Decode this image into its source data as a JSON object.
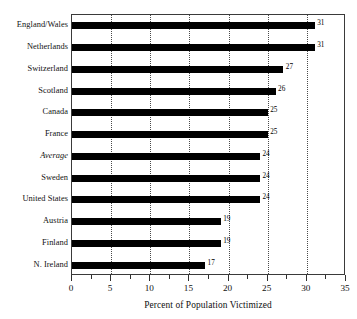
{
  "chart_data": {
    "type": "bar",
    "orientation": "horizontal",
    "title": "",
    "xlabel": "Percent of Population Victimized",
    "ylabel": "",
    "xlim": [
      0,
      35
    ],
    "ylim": null,
    "grid": "vertical-dotted-at-major-ticks",
    "legend": "none",
    "x_major_ticks": [
      0,
      5,
      10,
      15,
      20,
      25,
      30,
      35
    ],
    "x_minor_ticks": [
      2.5,
      7.5,
      12.5,
      17.5,
      22.5,
      27.5,
      32.5
    ],
    "x_tick_labels": [
      "0",
      "5",
      "10",
      "15",
      "20",
      "25",
      "30",
      "35"
    ],
    "categories": [
      "England/Wales",
      "Netherlands",
      "Switzerland",
      "Scotland",
      "Canada",
      "France",
      "Average",
      "Sweden",
      "United States",
      "Austria",
      "Finland",
      "N. Ireland"
    ],
    "values": [
      31,
      31,
      27,
      26,
      25,
      25,
      24,
      24,
      24,
      19,
      19,
      17
    ],
    "value_labels": [
      "31",
      "31",
      "27",
      "26",
      "25",
      "25",
      "24",
      "24",
      "24",
      "19",
      "19",
      "17"
    ],
    "emphasis": {
      "italic_categories": [
        "Average"
      ]
    },
    "colors": {
      "bar": "#000000",
      "frame": "#3a3a3a",
      "grid": "#4a4a4a",
      "text": "#111111"
    }
  }
}
